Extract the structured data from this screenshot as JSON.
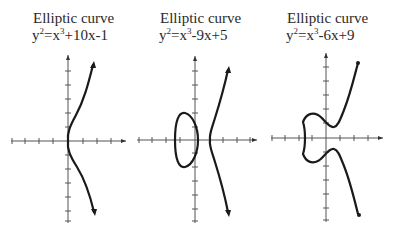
{
  "figure": {
    "panels": [
      {
        "title": "Elliptic curve",
        "eq_lhs": "y",
        "eq_lhs_exp": "2",
        "eq_mid": "=x",
        "eq_mid_exp": "3",
        "eq_rhs": "+10x-1",
        "equation": "y^2=x^3+10x-1"
      },
      {
        "title": "Elliptic curve",
        "eq_lhs": "y",
        "eq_lhs_exp": "2",
        "eq_mid": "=x",
        "eq_mid_exp": "3",
        "eq_rhs": "-9x+5",
        "equation": "y^2=x^3-9x+5"
      },
      {
        "title": "Elliptic curve",
        "eq_lhs": "y",
        "eq_lhs_exp": "2",
        "eq_mid": "=x",
        "eq_mid_exp": "3",
        "eq_rhs": "-6x+9",
        "equation": "y^2=x^3-6x+9"
      }
    ],
    "colors": {
      "curve": "#1a1a1a",
      "axis": "#444444",
      "text": "#2a2a2a",
      "background": "#ffffff"
    }
  }
}
